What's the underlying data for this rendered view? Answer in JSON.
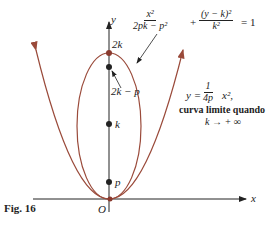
{
  "figure": {
    "caption": "Fig. 16",
    "axes": {
      "x_label": "x",
      "y_label": "y",
      "origin_label": "O"
    },
    "points": [
      {
        "label": "2k",
        "y_px": 53
      },
      {
        "label": "2k − p",
        "y_px": 67
      },
      {
        "label": "k",
        "y_px": 124
      },
      {
        "label": "p",
        "y_px": 182
      }
    ],
    "ellipse_equation": {
      "term1_num": "x²",
      "term1_den": "2pk − p²",
      "plus": "+",
      "term2_num": "(y − k)²",
      "term2_den": "k²",
      "rhs": "= 1"
    },
    "parabola_equation": {
      "lhs": "y =",
      "frac_num": "1",
      "frac_den": "4p",
      "rhs": "x²,"
    },
    "limit_text": "curva limite quando",
    "limit_condition": "k → + ∞",
    "colors": {
      "curve": "#9a4a3a",
      "axis": "#222222"
    }
  }
}
